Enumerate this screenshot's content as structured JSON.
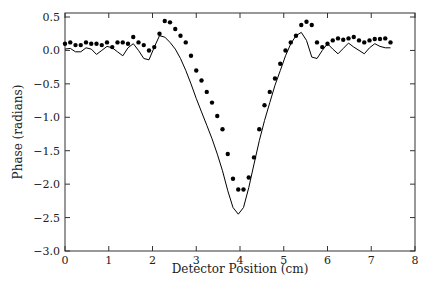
{
  "chart_data": {
    "type": "line",
    "title": "",
    "xlabel": "Detector Position (cm)",
    "ylabel": "Phase (radians)",
    "xlim": [
      0,
      8
    ],
    "ylim": [
      -3.0,
      0.5
    ],
    "xticks": [
      "0",
      "1",
      "2",
      "3",
      "4",
      "5",
      "6",
      "7",
      "8"
    ],
    "yticks": [
      "0.5",
      "0.0",
      "-0.5",
      "-1.0",
      "-1.5",
      "-2.0",
      "-2.5",
      "-3.0"
    ],
    "grid": false,
    "legend": null,
    "series": [
      {
        "name": "measured",
        "style": "markers",
        "x": [
          0.0,
          0.12,
          0.24,
          0.36,
          0.48,
          0.6,
          0.72,
          0.84,
          0.96,
          1.08,
          1.2,
          1.32,
          1.44,
          1.56,
          1.68,
          1.8,
          1.92,
          2.04,
          2.16,
          2.28,
          2.4,
          2.52,
          2.64,
          2.76,
          2.88,
          3.0,
          3.12,
          3.24,
          3.36,
          3.48,
          3.6,
          3.72,
          3.84,
          3.96,
          4.08,
          4.2,
          4.32,
          4.44,
          4.56,
          4.68,
          4.8,
          4.92,
          5.04,
          5.16,
          5.28,
          5.4,
          5.52,
          5.64,
          5.76,
          5.88,
          6.0,
          6.12,
          6.24,
          6.36,
          6.48,
          6.6,
          6.72,
          6.84,
          6.96,
          7.08,
          7.2,
          7.32,
          7.44
        ],
        "y": [
          0.1,
          0.12,
          0.08,
          0.08,
          0.12,
          0.1,
          0.1,
          0.08,
          0.12,
          0.05,
          0.12,
          0.12,
          0.1,
          0.2,
          0.12,
          0.08,
          0.0,
          0.05,
          0.25,
          0.44,
          0.42,
          0.32,
          0.22,
          0.12,
          -0.08,
          -0.3,
          -0.45,
          -0.62,
          -0.78,
          -0.98,
          -1.18,
          -1.55,
          -1.92,
          -2.08,
          -2.08,
          -1.9,
          -1.6,
          -1.18,
          -0.82,
          -0.62,
          -0.42,
          -0.2,
          0.0,
          0.12,
          0.22,
          0.38,
          0.43,
          0.38,
          0.12,
          0.05,
          0.1,
          0.15,
          0.18,
          0.16,
          0.18,
          0.2,
          0.15,
          0.12,
          0.15,
          0.17,
          0.17,
          0.18,
          0.12
        ],
        "color": "#000000"
      },
      {
        "name": "model",
        "style": "line",
        "x": [
          0.0,
          0.12,
          0.24,
          0.36,
          0.48,
          0.6,
          0.72,
          0.84,
          0.96,
          1.08,
          1.2,
          1.32,
          1.44,
          1.56,
          1.68,
          1.8,
          1.92,
          2.04,
          2.16,
          2.28,
          2.4,
          2.52,
          2.64,
          2.76,
          2.88,
          3.0,
          3.12,
          3.24,
          3.36,
          3.48,
          3.6,
          3.72,
          3.84,
          3.96,
          4.08,
          4.2,
          4.32,
          4.44,
          4.56,
          4.68,
          4.8,
          4.92,
          5.04,
          5.16,
          5.28,
          5.4,
          5.52,
          5.64,
          5.76,
          5.88,
          6.0,
          6.12,
          6.24,
          6.36,
          6.48,
          6.6,
          6.72,
          6.84,
          6.96,
          7.08,
          7.2,
          7.32,
          7.44
        ],
        "y": [
          0.02,
          0.03,
          -0.02,
          -0.02,
          0.04,
          0.02,
          -0.06,
          0.0,
          0.06,
          0.04,
          -0.02,
          -0.08,
          0.04,
          0.1,
          0.0,
          -0.12,
          -0.14,
          0.05,
          0.22,
          0.2,
          0.12,
          0.02,
          -0.12,
          -0.3,
          -0.5,
          -0.72,
          -0.92,
          -1.12,
          -1.32,
          -1.55,
          -1.8,
          -2.1,
          -2.35,
          -2.45,
          -2.35,
          -2.05,
          -1.7,
          -1.35,
          -1.05,
          -0.78,
          -0.52,
          -0.3,
          -0.08,
          0.1,
          0.22,
          0.27,
          0.15,
          -0.1,
          -0.12,
          0.0,
          0.1,
          0.02,
          -0.05,
          0.03,
          0.11,
          0.05,
          0.0,
          -0.05,
          0.04,
          0.1,
          0.06,
          0.04,
          0.04
        ],
        "color": "#000000"
      }
    ]
  }
}
